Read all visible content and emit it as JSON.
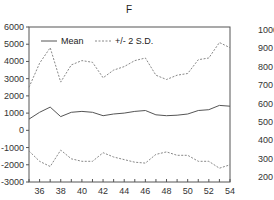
{
  "chart_data": {
    "type": "line",
    "title": "F",
    "xlabel": "",
    "ylabel": "",
    "x": [
      35,
      36,
      37,
      38,
      39,
      40,
      41,
      42,
      43,
      44,
      45,
      46,
      47,
      48,
      49,
      50,
      51,
      52,
      53,
      54
    ],
    "xlim": [
      35,
      54
    ],
    "ylim": [
      -3000,
      6000
    ],
    "x_ticks": [
      "36",
      "38",
      "40",
      "42",
      "44",
      "46",
      "48",
      "50",
      "52",
      "54"
    ],
    "y_ticks": [
      "6000",
      "5000",
      "4000",
      "3000",
      "2000",
      "1000",
      "0",
      "-1000",
      "-2000",
      "-3000"
    ],
    "grid": false,
    "legend_position": "top-left inside",
    "series": [
      {
        "name": "Mean",
        "style": "solid",
        "values": [
          650,
          1050,
          1350,
          800,
          1050,
          1100,
          1050,
          850,
          950,
          1000,
          1100,
          1150,
          900,
          850,
          880,
          950,
          1150,
          1200,
          1450,
          1400
        ]
      },
      {
        "name": "+/- 2 S.D.",
        "style": "dashed",
        "band": "upper",
        "values": [
          2500,
          3900,
          4800,
          2800,
          3800,
          4050,
          3950,
          3050,
          3500,
          3700,
          4050,
          4200,
          3200,
          2950,
          3200,
          3300,
          4100,
          4200,
          5100,
          4800
        ]
      },
      {
        "name": "+/- 2 S.D.",
        "style": "dashed",
        "band": "lower",
        "values": [
          -1200,
          -1800,
          -2100,
          -1150,
          -1650,
          -1800,
          -1800,
          -1300,
          -1550,
          -1700,
          -1850,
          -1900,
          -1400,
          -1250,
          -1450,
          -1450,
          -1800,
          -1800,
          -2200,
          -2000
        ]
      }
    ],
    "colors": {
      "mean": "#555555",
      "band": "#888888",
      "axis": "#444444"
    }
  },
  "legend": {
    "mean_label": "Mean",
    "sd_label": "+/- 2 S.D."
  },
  "adjacent_chart": {
    "y_ticks": [
      "1000",
      "900",
      "800",
      "700",
      "600",
      "500",
      "400",
      "300",
      "200"
    ]
  }
}
